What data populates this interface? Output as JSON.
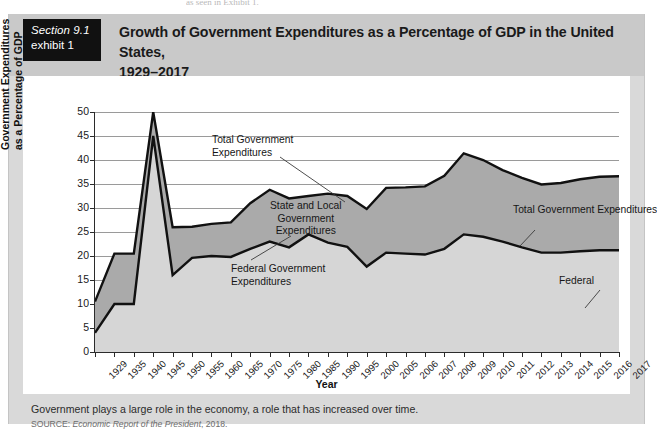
{
  "bleed_text": "as seen in Exhibit 1.",
  "exhibit": {
    "tag_line1": "Section 9.1",
    "tag_line2": "exhibit 1",
    "title_line1": "Growth of Government Expenditures as a Percentage of GDP in the United States,",
    "title_line2": "1929–2017"
  },
  "footer": {
    "caption": "Government plays a large role in the economy, a role that has increased over time.",
    "source_label": "SOURCE:",
    "source_italic": "Economic Report of the President",
    "source_year": ", 2018."
  },
  "annotations": {
    "total_left": {
      "line1": "Total Government",
      "line2": "Expenditures"
    },
    "state_local": {
      "line1": "State and Local",
      "line2": "Government",
      "line3": "Expenditures"
    },
    "federal_left": {
      "line1": "Federal Government",
      "line2": "Expenditures"
    },
    "total_right": "Total Government Expenditures",
    "federal_right": "Federal"
  },
  "colors": {
    "header_band": "#c9c9c9",
    "page_band": "#d9d9d9",
    "tag_bg": "#111111",
    "federal_fill": "#d6d6d6",
    "state_local_fill": "#aaaaaa",
    "line": "#111111",
    "grid": "#9a9a9a"
  },
  "chart_data": {
    "type": "area",
    "title": "Growth of Government Expenditures as a Percentage of GDP in the United States, 1929–2017",
    "xlabel": "Year",
    "ylabel": "Government Expenditures as a Percentage of GDP",
    "ylim": [
      0,
      50
    ],
    "yticks": [
      0,
      5,
      10,
      15,
      20,
      25,
      30,
      35,
      40,
      45,
      50
    ],
    "grid": true,
    "legend": "annotated-inline",
    "stacked": true,
    "categories": [
      "1929",
      "1935",
      "1940",
      "1945",
      "1950",
      "1955",
      "1960",
      "1965",
      "1970",
      "1975",
      "1980",
      "1985",
      "1990",
      "1995",
      "2000",
      "2005",
      "2006",
      "2007",
      "2008",
      "2009",
      "2010",
      "2011",
      "2012",
      "2013",
      "2014",
      "2015",
      "2016",
      "2017"
    ],
    "series": [
      {
        "name": "Federal Government Expenditures",
        "values": [
          4.0,
          10.0,
          10.0,
          45.0,
          16.0,
          19.6,
          20.0,
          19.8,
          21.5,
          23.0,
          21.8,
          24.5,
          22.8,
          21.9,
          17.8,
          20.7,
          20.5,
          20.3,
          21.5,
          24.5,
          24.0,
          23.0,
          21.8,
          20.7,
          20.7,
          21.0,
          21.2,
          21.2
        ]
      },
      {
        "name": "State and Local Government Expenditures",
        "values": [
          6.5,
          10.5,
          10.5,
          5.0,
          10.0,
          6.5,
          6.7,
          7.2,
          9.5,
          10.8,
          10.2,
          8.0,
          10.2,
          10.6,
          12.0,
          13.5,
          13.8,
          14.2,
          15.2,
          16.9,
          16.0,
          14.9,
          14.5,
          14.2,
          14.5,
          15.0,
          15.3,
          15.4
        ]
      }
    ],
    "total": {
      "name": "Total Government Expenditures",
      "values": [
        10.5,
        20.5,
        20.5,
        50.0,
        26.0,
        26.1,
        26.7,
        27.0,
        31.0,
        33.8,
        32.0,
        32.5,
        33.0,
        32.5,
        29.8,
        34.2,
        34.3,
        34.5,
        36.7,
        41.4,
        40.0,
        37.9,
        36.3,
        34.9,
        35.2,
        36.0,
        36.5,
        36.6
      ]
    }
  }
}
